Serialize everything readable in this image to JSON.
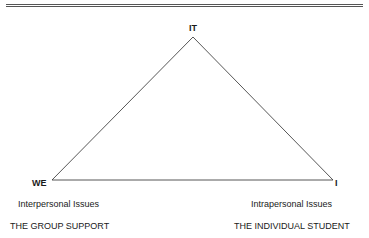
{
  "diagram": {
    "type": "triangle",
    "vertices": {
      "top": {
        "label": "IT"
      },
      "left": {
        "label": "WE",
        "issue": "Interpersonal Issues",
        "caption": "THE GROUP SUPPORT"
      },
      "right": {
        "label": "I",
        "issue": "Intrapersonal Issues",
        "caption": "THE INDIVIDUAL STUDENT"
      }
    },
    "line_color": "#444444"
  }
}
